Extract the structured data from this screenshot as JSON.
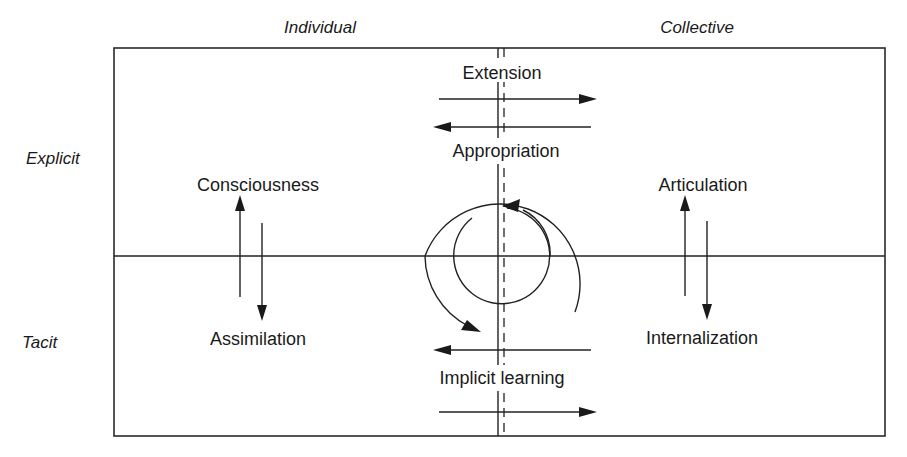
{
  "diagram": {
    "column_headers": {
      "individual": "Individual",
      "collective": "Collective"
    },
    "row_headers": {
      "explicit": "Explicit",
      "tacit": "Tacit"
    },
    "individual_processes": {
      "up": "Consciousness",
      "down": "Assimilation"
    },
    "collective_processes": {
      "up": "Articulation",
      "down": "Internalization"
    },
    "cross_level_explicit": {
      "rightward": "Extension",
      "leftward": "Appropriation"
    },
    "cross_level_tacit": {
      "leftward": "Implicit learning",
      "rightward": ""
    },
    "center": {
      "element": "spiral",
      "direction": "clockwise outer, counter-clockwise inner"
    },
    "colors": {
      "line": "#222222",
      "text": "#1a1a1a",
      "background": "#ffffff"
    }
  }
}
